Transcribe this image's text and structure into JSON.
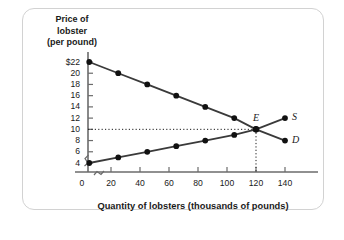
{
  "figure": {
    "y_axis_title": [
      "Price of",
      "lobster",
      "(per pound)"
    ],
    "x_axis_title": "Quantity of lobsters (thousands of pounds)"
  },
  "labels": {
    "supply": "S",
    "demand": "D",
    "equilibrium": "E"
  },
  "chart_data": {
    "type": "line",
    "title": "",
    "xlabel": "Quantity of lobsters (thousands of pounds)",
    "ylabel": "Price of lobster (per pound)",
    "xlim": [
      0,
      145
    ],
    "ylim": [
      3,
      23
    ],
    "xticks": [
      "0",
      "20",
      "40",
      "60",
      "80",
      "100",
      "120",
      "140"
    ],
    "xtick_values": [
      0,
      20,
      40,
      60,
      80,
      100,
      120,
      140
    ],
    "yticks": [
      "$22",
      "20",
      "18",
      "16",
      "14",
      "12",
      "10",
      "8",
      "6",
      "4"
    ],
    "ytick_values": [
      22,
      20,
      18,
      16,
      14,
      12,
      10,
      8,
      6,
      4
    ],
    "grid": false,
    "legend": "inline-curve-labels",
    "axis_break_x": true,
    "axis_break_y": true,
    "series": [
      {
        "name": "D",
        "label": "D",
        "description": "Demand curve, downward sloping",
        "x": [
          5,
          25,
          45,
          65,
          85,
          105,
          120,
          140
        ],
        "values": [
          22,
          20,
          18,
          16,
          14,
          12,
          10,
          8
        ],
        "color": "#3a3a3a"
      },
      {
        "name": "S",
        "label": "S",
        "description": "Supply curve, upward sloping",
        "x": [
          5,
          25,
          45,
          65,
          85,
          105,
          120,
          140
        ],
        "values": [
          4,
          5,
          6,
          7,
          8,
          9,
          10,
          12
        ],
        "color": "#3a3a3a"
      }
    ],
    "annotations": [
      {
        "label": "E",
        "type": "equilibrium-point",
        "x": 120,
        "y": 10,
        "price": 10,
        "quantity": 120,
        "leader_lines": "dotted to price axis and quantity axis"
      }
    ]
  }
}
